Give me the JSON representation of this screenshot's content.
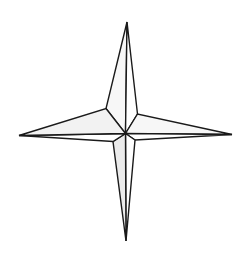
{
  "figure": {
    "canvas": {
      "width": 248,
      "height": 260
    },
    "background_color": "#ffffff"
  },
  "colors": {
    "background": "#ffffff",
    "outline": "#1a1a1a",
    "outline_soft": "#2b2b2b",
    "facet_light": "#ffffff",
    "facet_shade": "#f2f2f2",
    "facet_shade_deep": "#ebebeb",
    "facet_shade_soft": "#f7f7f7"
  },
  "geometry": {
    "center": {
      "x": 125.5,
      "y": 133.5
    },
    "tips": {
      "north": {
        "x": 127.0,
        "y": 22.0
      },
      "south": {
        "x": 126.0,
        "y": 241.0
      },
      "west": {
        "x": 19.0,
        "y": 135.5
      },
      "east": {
        "x": 232.0,
        "y": 134.5
      }
    },
    "shoulders": {
      "northwest": {
        "x": 106.0,
        "y": 108.5
      },
      "northeast": {
        "x": 137.5,
        "y": 114.0
      },
      "southwest": {
        "x": 113.0,
        "y": 141.5
      },
      "southeast": {
        "x": 135.0,
        "y": 140.0
      }
    },
    "facets": [
      {
        "name": "north-west-facet",
        "points": "127,22 106,108.5 125.5,133.5",
        "fill": "#f7f7f7"
      },
      {
        "name": "north-east-facet",
        "points": "127,22 125.5,133.5 137.5,114",
        "fill": "#ffffff"
      },
      {
        "name": "east-north-facet",
        "points": "232,134.5 137.5,114 125.5,133.5",
        "fill": "#f7f7f7"
      },
      {
        "name": "east-south-facet",
        "points": "232,134.5 125.5,133.5 135,140",
        "fill": "#ffffff"
      },
      {
        "name": "south-east-facet",
        "points": "126,241 135,140 125.5,133.5",
        "fill": "#ffffff"
      },
      {
        "name": "south-west-facet",
        "points": "126,241 125.5,133.5 113,141.5",
        "fill": "#ebebeb"
      },
      {
        "name": "west-south-facet",
        "points": "19,135.5 113,141.5 125.5,133.5",
        "fill": "#ffffff"
      },
      {
        "name": "west-north-facet",
        "points": "19,135.5 125.5,133.5 106,108.5",
        "fill": "#f2f2f2"
      }
    ],
    "stroke_width": 1.4
  }
}
